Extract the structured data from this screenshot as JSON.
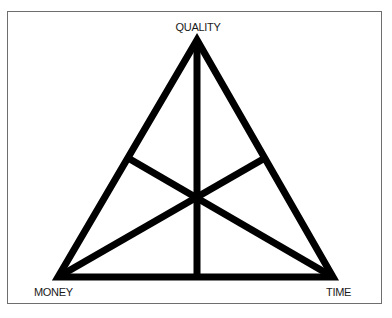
{
  "diagram": {
    "type": "triangle-with-medians",
    "labels": {
      "top": "QUALITY",
      "bottom_left": "MONEY",
      "bottom_right": "TIME"
    },
    "colors": {
      "stroke": "#000000",
      "frame": "#6e6e6e",
      "background": "#ffffff",
      "text": "#1a1a1a"
    }
  }
}
